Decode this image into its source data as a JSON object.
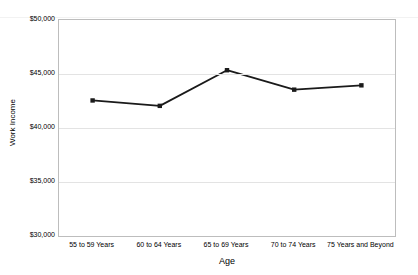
{
  "chart_data": {
    "type": "line",
    "title": "",
    "xlabel": "Age",
    "ylabel": "Work Income",
    "categories": [
      "55 to 59 Years",
      "60 to 64 Years",
      "65 to 69 Years",
      "70 to 74 Years",
      "75 Years and Beyond"
    ],
    "series": [
      {
        "name": "Work Income",
        "values": [
          42550,
          42050,
          45350,
          43550,
          43950
        ],
        "color": "#1a1a1a",
        "marker": "square"
      }
    ],
    "ylim": [
      30000,
      50000
    ],
    "yticks": [
      30000,
      35000,
      40000,
      45000,
      50000
    ],
    "ytick_labels": [
      "$30,000",
      "$35,000",
      "$40,000",
      "$45,000",
      "$50,000"
    ],
    "grid": "horizontal",
    "legend": "none",
    "plot_border_color": "#bdbdbd",
    "gridline_color": "#e3e3e3",
    "background_color": "#ffffff"
  }
}
